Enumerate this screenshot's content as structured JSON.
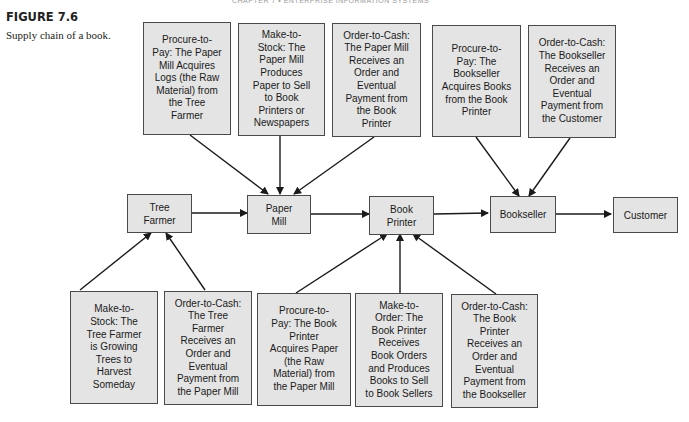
{
  "header": {
    "running_head": "CHAPTER 7 • ENTERPRISE INFORMATION SYSTEMS"
  },
  "figure": {
    "label": "FIGURE 7.6",
    "caption": "Supply chain of a book."
  },
  "nodes": {
    "tree_farmer": "Tree\nFarmer",
    "paper_mill": "Paper\nMill",
    "book_printer": "Book\nPrinter",
    "bookseller": "Bookseller",
    "customer": "Customer"
  },
  "top_boxes": [
    {
      "text": "Procure-to-\nPay: The Paper\nMill Acquires\nLogs (the Raw\nMaterial) from\nthe Tree\nFarmer"
    },
    {
      "text": "Make-to-\nStock: The\nPaper Mill\nProduces\nPaper to Sell\nto Book\nPrinters or\nNewspapers"
    },
    {
      "text": "Order-to-Cash:\nThe Paper Mill\nReceives an\nOrder and\nEventual\nPayment from\nthe Book\nPrinter"
    },
    {
      "text": "Procure-to-\nPay: The\nBookseller\nAcquires Books\nfrom the Book\nPrinter"
    },
    {
      "text": "Order-to-Cash:\nThe Bookseller\nReceives an\nOrder and\nEventual\nPayment from\nthe Customer"
    }
  ],
  "bottom_boxes": [
    {
      "text": "Make-to-\nStock: The\nTree Farmer\nis Growing\nTrees to\nHarvest\nSomeday"
    },
    {
      "text": "Order-to-Cash:\nThe Tree\nFarmer\nReceives an\nOrder and\nEventual\nPayment from\nthe Paper Mill"
    },
    {
      "text": "Procure-to-\nPay: The Book\nPrinter\nAcquires Paper\n(the Raw\nMaterial) from\nthe Paper Mill"
    },
    {
      "text": "Make-to-\nOrder: The\nBook Printer\nReceives\nBook Orders\nand Produces\nBooks to Sell\nto Book Sellers"
    },
    {
      "text": "Order-to-Cash:\nThe Book\nPrinter\nReceives an\nOrder and\nEventual\nPayment from\nthe Bookseller"
    }
  ]
}
